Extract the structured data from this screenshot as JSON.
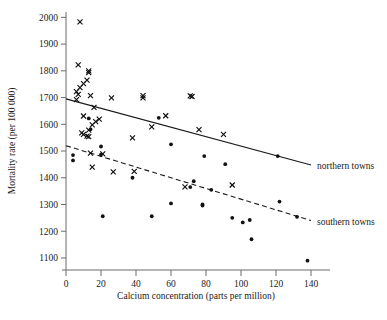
{
  "chart_data": {
    "type": "scatter",
    "title": "",
    "xlabel": "Calcium concentration (parts per million)",
    "ylabel": "Mortality rate (per 100 000)",
    "xlim": [
      0,
      148
    ],
    "ylim": [
      1055,
      2020
    ],
    "xticks": [
      0,
      20,
      40,
      60,
      80,
      100,
      120,
      140
    ],
    "xtick_labels": [
      "0",
      "20",
      "40",
      "60",
      "80",
      "100",
      "120",
      "140"
    ],
    "yticks": [
      1100,
      1200,
      1300,
      1400,
      1500,
      1600,
      1700,
      1800,
      1900,
      2000
    ],
    "ytick_labels": [
      "1100",
      "1200",
      "1300",
      "1400",
      "1500",
      "1600",
      "1700",
      "1800",
      "1900",
      "2000"
    ],
    "grid": false,
    "legend_position": "right-inline",
    "series": [
      {
        "name": "northern towns",
        "marker": "cross",
        "label": "northern towns",
        "trend": {
          "style": "solid",
          "x": [
            0,
            140
          ],
          "y": [
            1695,
            1448
          ]
        },
        "points": [
          [
            8,
            1983
          ],
          [
            7,
            1822
          ],
          [
            6,
            1722
          ],
          [
            7,
            1712
          ],
          [
            6,
            1692
          ],
          [
            8,
            1737
          ],
          [
            10,
            1752
          ],
          [
            12,
            1765
          ],
          [
            13,
            1800
          ],
          [
            13,
            1793
          ],
          [
            14,
            1707
          ],
          [
            16,
            1663
          ],
          [
            10,
            1631
          ],
          [
            13,
            1578
          ],
          [
            15,
            1598
          ],
          [
            17,
            1610
          ],
          [
            19,
            1619
          ],
          [
            9,
            1568
          ],
          [
            10,
            1562
          ],
          [
            12,
            1556
          ],
          [
            13,
            1554
          ],
          [
            26,
            1699
          ],
          [
            44,
            1707
          ],
          [
            44,
            1699
          ],
          [
            71,
            1706
          ],
          [
            72,
            1704
          ],
          [
            21,
            1489
          ],
          [
            14,
            1492
          ],
          [
            15,
            1440
          ],
          [
            27,
            1422
          ],
          [
            39,
            1424
          ],
          [
            38,
            1549
          ],
          [
            49,
            1590
          ],
          [
            57,
            1632
          ],
          [
            76,
            1580
          ],
          [
            90,
            1562
          ],
          [
            68,
            1366
          ],
          [
            95,
            1373
          ]
        ]
      },
      {
        "name": "southern towns",
        "marker": "dot",
        "label": "southern towns",
        "trend": {
          "style": "dashed",
          "x": [
            0,
            140
          ],
          "y": [
            1520,
            1240
          ]
        },
        "points": [
          [
            4,
            1485
          ],
          [
            4,
            1465
          ],
          [
            13,
            1622
          ],
          [
            14,
            1581
          ],
          [
            20,
            1517
          ],
          [
            20,
            1486
          ],
          [
            21,
            1256
          ],
          [
            38,
            1400
          ],
          [
            49,
            1256
          ],
          [
            53,
            1624
          ],
          [
            60,
            1525
          ],
          [
            60,
            1304
          ],
          [
            71,
            1365
          ],
          [
            73,
            1387
          ],
          [
            78,
            1300
          ],
          [
            78,
            1296
          ],
          [
            79,
            1481
          ],
          [
            83,
            1355
          ],
          [
            91,
            1451
          ],
          [
            95,
            1250
          ],
          [
            101,
            1233
          ],
          [
            105,
            1242
          ],
          [
            106,
            1170
          ],
          [
            121,
            1481
          ],
          [
            122,
            1311
          ],
          [
            132,
            1254
          ],
          [
            138,
            1090
          ]
        ]
      }
    ]
  }
}
